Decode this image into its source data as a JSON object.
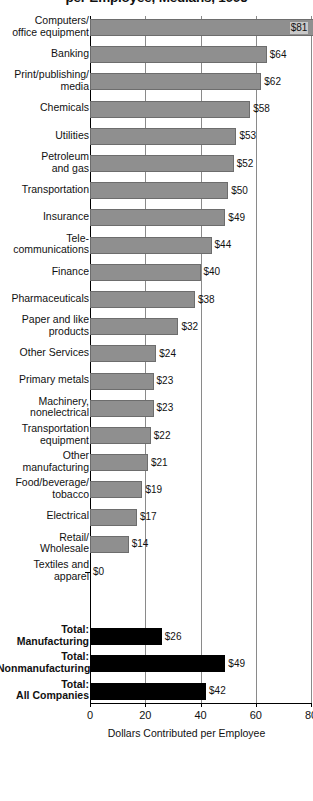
{
  "chart": {
    "title": "per Employee, Medians, 1995",
    "xaxis_title": "Dollars Contributed per Employee"
  },
  "chart_data": {
    "type": "bar",
    "orientation": "horizontal",
    "title": "per Employee, Medians, 1995",
    "xlabel": "Dollars Contributed per Employee",
    "ylabel": "",
    "xlim": [
      0,
      80
    ],
    "xticks": [
      0,
      20,
      40,
      60,
      80
    ],
    "grid": true,
    "legend": "none",
    "categories": [
      "Computers/\noffice equipment",
      "Banking",
      "Print/publishing/\nmedia",
      "Chemicals",
      "Utilities",
      "Petroleum\nand gas",
      "Transportation",
      "Insurance",
      "Tele-\ncommunications",
      "Finance",
      "Pharmaceuticals",
      "Paper and like\nproducts",
      "Other Services",
      "Primary metals",
      "Machinery,\nnonelectrical",
      "Transportation\nequipment",
      "Other\nmanufacturing",
      "Food/beverage/\ntobacco",
      "Electrical",
      "Retail/\nWholesale",
      "Textiles and\napparel",
      "Total:\nManufacturing",
      "Total:\nNonmanufacturing",
      "Total:\nAll Companies"
    ],
    "values": [
      81,
      64,
      62,
      58,
      53,
      52,
      50,
      49,
      44,
      40,
      38,
      32,
      24,
      23,
      23,
      22,
      21,
      19,
      17,
      14,
      0,
      26,
      49,
      42
    ],
    "value_labels": [
      "$81",
      "$64",
      "$62",
      "$58",
      "$53",
      "$52",
      "$50",
      "$49",
      "$44",
      "$40",
      "$38",
      "$32",
      "$24",
      "$23",
      "$23",
      "$22",
      "$21",
      "$19",
      "$17",
      "$14",
      "$0",
      "$26",
      "$49",
      "$42"
    ],
    "series_group": [
      "industry",
      "industry",
      "industry",
      "industry",
      "industry",
      "industry",
      "industry",
      "industry",
      "industry",
      "industry",
      "industry",
      "industry",
      "industry",
      "industry",
      "industry",
      "industry",
      "industry",
      "industry",
      "industry",
      "industry",
      "industry",
      "total",
      "total",
      "total"
    ],
    "xtick_labels": [
      "0",
      "20",
      "40",
      "60",
      "80"
    ],
    "colors": {
      "industry_bar": "#8f8f8f",
      "industry_bar_border": "#6d6d6d",
      "total_bar": "#000000",
      "gridline": "#8a8a8a",
      "axis": "#000000",
      "text": "#111111",
      "background": "#ffffff"
    }
  }
}
